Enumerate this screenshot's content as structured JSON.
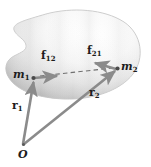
{
  "figure": {
    "background_color": "#ffffff",
    "body": {
      "name": "rigid-body-blob",
      "fill_light": "#fdfdfd",
      "fill_mid": "#e2e2e2",
      "fill_dark": "#b9b9b9",
      "outline_color": "#c9c9c9"
    },
    "vector_color": "#8b8b8b",
    "vector_dark_color": "#6f6f6f",
    "label_color": "#1d1d1d",
    "dash_color": "#6f6f6f"
  },
  "points": [
    {
      "id": "origin",
      "label": "O",
      "sub": "",
      "x": 23,
      "y": 145,
      "label_x": 19,
      "label_y": 150
    },
    {
      "id": "mass1",
      "label": "m",
      "sub": "1",
      "x": 33,
      "y": 78,
      "label_x": 14,
      "label_y": 70
    },
    {
      "id": "mass2",
      "label": "m",
      "sub": "2",
      "x": 118,
      "y": 68,
      "label_x": 121,
      "label_y": 62
    }
  ],
  "vectors": [
    {
      "id": "r1",
      "label": "r",
      "sub": "1",
      "from": "origin",
      "to": "mass1",
      "label_x": 13,
      "label_y": 105,
      "kind": "position"
    },
    {
      "id": "r2",
      "label": "r",
      "sub": "2",
      "from": "origin",
      "to": "mass2",
      "label_x": 90,
      "label_y": 92,
      "kind": "position"
    },
    {
      "id": "f12",
      "label": "f",
      "sub": "12",
      "from": "mass1",
      "to": "force1-tip",
      "label_x": 42,
      "label_y": 55,
      "kind": "force"
    },
    {
      "id": "f21",
      "label": "f",
      "sub": "21",
      "from": "mass2",
      "to": "force2-tip",
      "label_x": 88,
      "label_y": 50,
      "kind": "force"
    }
  ],
  "connector": {
    "id": "dashed-line",
    "label": "",
    "style": "dashed",
    "from": "mass1",
    "to": "mass2"
  }
}
